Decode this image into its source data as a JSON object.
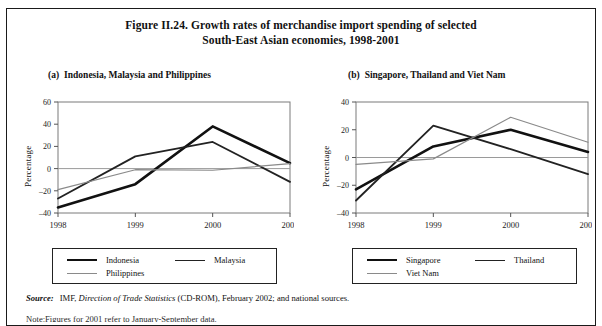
{
  "figure": {
    "title_line1": "Figure II.24.  Growth rates of merchandise import spending of selected",
    "title_line2": "South-East Asian economies, 1998-2001"
  },
  "panels": {
    "a": {
      "tag": "(a)",
      "subtitle": "Indonesia, Malaysia and Philippines"
    },
    "b": {
      "tag": "(b)",
      "subtitle": "Singapore, Thailand and Viet Nam"
    }
  },
  "legend_a": {
    "items": [
      {
        "label": "Indonesia",
        "color": "#111111",
        "width": 2.6
      },
      {
        "label": "Malaysia",
        "color": "#222222",
        "width": 1.8
      },
      {
        "label": "Philippines",
        "color": "#8a8a8a",
        "width": 1.2
      }
    ]
  },
  "legend_b": {
    "items": [
      {
        "label": "Singapore",
        "color": "#111111",
        "width": 2.6
      },
      {
        "label": "Thailand",
        "color": "#222222",
        "width": 1.8
      },
      {
        "label": "Viet Nam",
        "color": "#8a8a8a",
        "width": 1.2
      }
    ]
  },
  "source": {
    "label": "Source:",
    "text_before": "IMF,",
    "italic_title": "Direction of Trade Statistics",
    "text_after": "(CD-ROM), February 2002; and national sources."
  },
  "note": {
    "label": "Note:",
    "text": "Figures for 2001 refer to January-September data."
  },
  "chart_data": [
    {
      "type": "line",
      "panel": "a",
      "title": "Indonesia, Malaysia and Philippines",
      "xlabel": "",
      "ylabel": "Percentage",
      "categories": [
        "1998",
        "1999",
        "2000",
        "2001"
      ],
      "ylim": [
        -40,
        60
      ],
      "yticks": [
        -40,
        -20,
        0,
        20,
        40,
        60
      ],
      "ytick_labels": [
        "–40",
        "–20",
        "0",
        "20",
        "40",
        "60"
      ],
      "grid": false,
      "legend_position": "below",
      "series": [
        {
          "name": "Indonesia",
          "values": [
            -35,
            -14,
            38,
            5
          ]
        },
        {
          "name": "Malaysia",
          "values": [
            -27,
            11,
            24,
            -12
          ]
        },
        {
          "name": "Philippines",
          "values": [
            -19,
            -1,
            -1.5,
            4.5
          ]
        }
      ]
    },
    {
      "type": "line",
      "panel": "b",
      "title": "Singapore, Thailand and Viet Nam",
      "xlabel": "",
      "ylabel": "Percentage",
      "categories": [
        "1998",
        "1999",
        "2000",
        "2001"
      ],
      "ylim": [
        -40,
        40
      ],
      "yticks": [
        -40,
        -20,
        0,
        20,
        40
      ],
      "ytick_labels": [
        "–40",
        "–20",
        "0",
        "20",
        "40"
      ],
      "grid": false,
      "legend_position": "below",
      "series": [
        {
          "name": "Singapore",
          "values": [
            -23,
            8,
            20,
            4
          ]
        },
        {
          "name": "Thailand",
          "values": [
            -31,
            23,
            6,
            -12
          ]
        },
        {
          "name": "Viet Nam",
          "values": [
            -5,
            -1,
            29,
            11
          ]
        }
      ]
    }
  ]
}
